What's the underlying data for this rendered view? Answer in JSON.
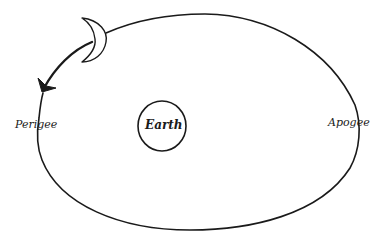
{
  "diagram": {
    "type": "orbit",
    "title": "",
    "labels": {
      "perigee": "Perigee",
      "earth": "Earth",
      "apogee": "Apogee"
    },
    "elements": [
      {
        "name": "orbit-ellipse",
        "shape": "ellipse"
      },
      {
        "name": "earth",
        "shape": "circle"
      },
      {
        "name": "moon",
        "shape": "crescent"
      },
      {
        "name": "motion-arrow",
        "shape": "curved-arrow",
        "direction": "counterclockwise toward perigee"
      }
    ],
    "colors": {
      "stroke": "#1a1a1a",
      "background": "#ffffff"
    }
  }
}
